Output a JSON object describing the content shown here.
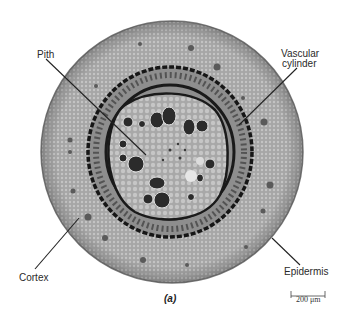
{
  "figure": {
    "panel_label": "(a)",
    "labels": {
      "pith": "Pith",
      "vascular_line1": "Vascular",
      "vascular_line2": "cylinder",
      "cortex": "Cortex",
      "epidermis": "Epidermis"
    },
    "scale_bar": {
      "text": "200 μm"
    },
    "colors": {
      "background": "#ffffff",
      "cortex": "#a9a9a9",
      "epidermis": "#8c8c8c",
      "vascular_ring": "#1a1a1a",
      "pith": "#b8b8b8",
      "vessels": "#2b2b2b",
      "leader_lines": "#222222"
    }
  }
}
